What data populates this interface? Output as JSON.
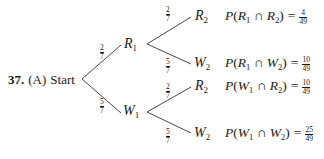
{
  "problem": {
    "number": "37.",
    "part": "(A)",
    "start_label": "Start"
  },
  "tree": {
    "level1": [
      {
        "node": "R",
        "sub": "1",
        "prob_num": "2",
        "prob_den": "7"
      },
      {
        "node": "W",
        "sub": "1",
        "prob_num": "5",
        "prob_den": "7"
      }
    ],
    "level2": [
      {
        "parent": "R1",
        "node": "R",
        "sub": "2",
        "prob_num": "2",
        "prob_den": "7",
        "formula": {
          "p": "P",
          "a": "R",
          "a_sub": "1",
          "cap": "∩",
          "b": "R",
          "b_sub": "2",
          "eq": "=",
          "num": "4",
          "den": "49"
        }
      },
      {
        "parent": "R1",
        "node": "W",
        "sub": "2",
        "prob_num": "5",
        "prob_den": "7",
        "formula": {
          "p": "P",
          "a": "R",
          "a_sub": "1",
          "cap": "∩",
          "b": "W",
          "b_sub": "2",
          "eq": "=",
          "num": "10",
          "den": "49"
        }
      },
      {
        "parent": "W1",
        "node": "R",
        "sub": "2",
        "prob_num": "2",
        "prob_den": "7",
        "formula": {
          "p": "P",
          "a": "W",
          "a_sub": "1",
          "cap": "∩",
          "b": "R",
          "b_sub": "2",
          "eq": "=",
          "num": "10",
          "den": "49"
        }
      },
      {
        "parent": "W1",
        "node": "W",
        "sub": "2",
        "prob_num": "5",
        "prob_den": "7",
        "formula": {
          "p": "P",
          "a": "W",
          "a_sub": "1",
          "cap": "∩",
          "b": "W",
          "b_sub": "2",
          "eq": "=",
          "num": "25",
          "den": "49"
        }
      }
    ]
  },
  "colors": {
    "ink": "#1a1a1a",
    "background": "#ffffff"
  }
}
